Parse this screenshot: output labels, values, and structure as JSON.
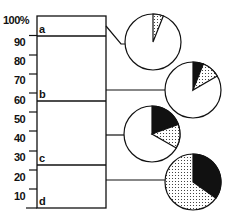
{
  "title": "",
  "axis": {
    "labels": [
      "100%",
      "90",
      "80",
      "70",
      "60",
      "50",
      "40",
      "30",
      "20",
      "10"
    ],
    "min": 0,
    "max": 100
  },
  "bar": {
    "segments": [
      {
        "label": "a",
        "top_pct": 100,
        "bottom_pct": 90
      },
      {
        "label": "b",
        "top_pct": 90,
        "bottom_pct": 56
      },
      {
        "label": "c",
        "top_pct": 56,
        "bottom_pct": 22
      },
      {
        "label": "d",
        "top_pct": 22,
        "bottom_pct": 0
      }
    ]
  },
  "pies": [
    {
      "segment": "a",
      "slices": [
        {
          "fill": "dotted",
          "pct": 6
        },
        {
          "fill": "white",
          "pct": 94
        }
      ]
    },
    {
      "segment": "b",
      "slices": [
        {
          "fill": "black",
          "pct": 6
        },
        {
          "fill": "dotted",
          "pct": 11
        },
        {
          "fill": "white",
          "pct": 83
        }
      ]
    },
    {
      "segment": "c",
      "slices": [
        {
          "fill": "black",
          "pct": 19
        },
        {
          "fill": "dotted",
          "pct": 14
        },
        {
          "fill": "white",
          "pct": 67
        }
      ]
    },
    {
      "segment": "d",
      "slices": [
        {
          "fill": "black",
          "pct": 35
        },
        {
          "fill": "dotted",
          "pct": 65
        }
      ]
    }
  ],
  "colors": {
    "ink": "#111111",
    "paper": "#ffffff"
  }
}
